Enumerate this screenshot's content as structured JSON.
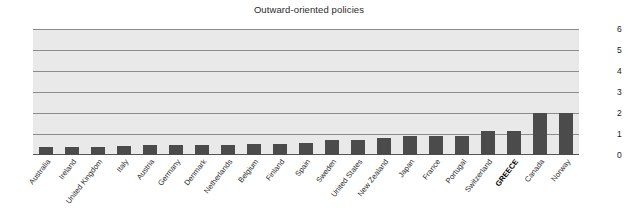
{
  "chart_data": {
    "type": "bar",
    "title": "Outward-oriented policies",
    "xlabel": "",
    "ylabel": "",
    "ylim": [
      0,
      6
    ],
    "yticks": [
      0,
      1,
      2,
      3,
      4,
      5,
      6
    ],
    "ytick_labels": [
      "0",
      "1",
      "2",
      "3",
      "4",
      "5",
      "6"
    ],
    "grid": true,
    "legend": "none",
    "dual_y_axis": true,
    "bar_color": "#4b4b4b",
    "plot_background": "#e9e9e9",
    "highlight_category": "GREECE",
    "categories": [
      "Australia",
      "Ireland",
      "United Kingdom",
      "Italy",
      "Austria",
      "Germany",
      "Denmark",
      "Netherlands",
      "Belgium",
      "Finland",
      "Spain",
      "Sweden",
      "United States",
      "New Zealand",
      "Japan",
      "France",
      "Portugal",
      "Switzerland",
      "GREECE",
      "Canada",
      "Norway"
    ],
    "values": [
      0.38,
      0.38,
      0.38,
      0.44,
      0.47,
      0.47,
      0.47,
      0.47,
      0.53,
      0.54,
      0.57,
      0.72,
      0.73,
      0.8,
      0.9,
      0.89,
      0.92,
      1.12,
      1.13,
      2.0,
      2.0
    ]
  }
}
